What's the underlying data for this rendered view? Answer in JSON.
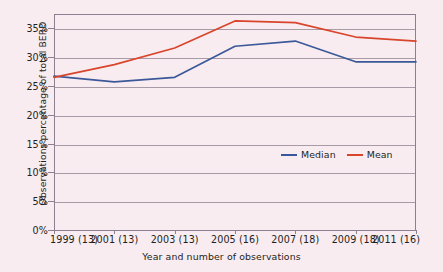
{
  "chart_data": {
    "type": "line",
    "title": "",
    "xlabel": "Year and number of observations",
    "ylabel": "Observations percentage of total BERD",
    "categories": [
      "1999 (13)",
      "2001 (13)",
      "2003 (13)",
      "2005 (16)",
      "2007 (18)",
      "2009 (18)",
      "2011 (16)"
    ],
    "x_values": [
      1999,
      2001,
      2003,
      2005,
      2007,
      2009,
      2011
    ],
    "observation_counts": [
      13,
      13,
      13,
      16,
      18,
      18,
      16
    ],
    "series": [
      {
        "name": "Median",
        "color": "#3b5998",
        "values": [
          26.7,
          25.7,
          26.5,
          31.9,
          32.8,
          29.2,
          29.2
        ]
      },
      {
        "name": "Mean",
        "color": "#d8452a",
        "values": [
          26.5,
          28.7,
          31.6,
          36.3,
          36.0,
          33.5,
          32.8
        ]
      }
    ],
    "ylim": [
      0,
      37.5
    ],
    "ytick_values": [
      0,
      5,
      10,
      15,
      20,
      25,
      30,
      35
    ],
    "ytick_labels": [
      "0%",
      "5%",
      "10%",
      "15%",
      "20%",
      "25%",
      "30%",
      "35%"
    ],
    "grid": true,
    "legend_position": "inside-center-right",
    "background_color": "#f9ecf1",
    "axis_color": "#8a8091",
    "grid_color": "#a89ba6"
  },
  "legend": {
    "items": [
      {
        "label": "Median"
      },
      {
        "label": "Mean"
      }
    ]
  }
}
